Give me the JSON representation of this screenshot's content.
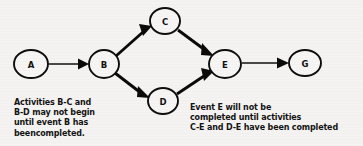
{
  "diagram": {
    "type": "network-activity-diagram",
    "background_color": "#f4f3f1",
    "ink_color": "#111111",
    "nodes": [
      {
        "id": "A",
        "label": "A",
        "cx": 31,
        "cy": 64,
        "rx": 17,
        "ry": 14
      },
      {
        "id": "B",
        "label": "B",
        "cx": 104,
        "cy": 64,
        "rx": 15,
        "ry": 14
      },
      {
        "id": "C",
        "label": "C",
        "cx": 165,
        "cy": 21,
        "rx": 15,
        "ry": 13
      },
      {
        "id": "D",
        "label": "D",
        "cx": 163,
        "cy": 101,
        "rx": 15,
        "ry": 13
      },
      {
        "id": "E",
        "label": "E",
        "cx": 225,
        "cy": 64,
        "rx": 16,
        "ry": 14
      },
      {
        "id": "G",
        "label": "G",
        "cx": 305,
        "cy": 63,
        "rx": 16,
        "ry": 13
      }
    ],
    "edges": [
      {
        "from": "A",
        "to": "B",
        "weight": "thin",
        "orientation": "horizontal"
      },
      {
        "from": "B",
        "to": "C",
        "weight": "thick",
        "orientation": "diagonal-up"
      },
      {
        "from": "B",
        "to": "D",
        "weight": "thick",
        "orientation": "diagonal-down"
      },
      {
        "from": "C",
        "to": "E",
        "weight": "thick",
        "orientation": "diagonal-down"
      },
      {
        "from": "D",
        "to": "E",
        "weight": "thick",
        "orientation": "diagonal-up"
      },
      {
        "from": "E",
        "to": "G",
        "weight": "thin",
        "orientation": "horizontal"
      }
    ]
  },
  "captions": {
    "left": {
      "lines": [
        "Activities B-C and",
        "B-D may not begin",
        "until event B has",
        "beencompleted."
      ]
    },
    "right": {
      "lines": [
        "Event E will not be",
        "completed until activities",
        "C-E and D-E have been completed"
      ]
    }
  }
}
